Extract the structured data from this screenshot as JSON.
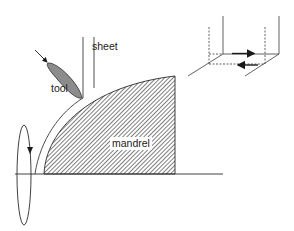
{
  "diagram": {
    "type": "schematic",
    "labels": {
      "sheet": "sheet",
      "tool": "tool",
      "mandrel": "mandrel"
    },
    "colors": {
      "stroke": "#2a2a2a",
      "tool_fill": "#8c8c8c",
      "hatch": "#3a3a3a",
      "background": "#ffffff"
    },
    "elements": [
      {
        "id": "mandrel",
        "kind": "hatched-region"
      },
      {
        "id": "sheet",
        "kind": "double-line"
      },
      {
        "id": "tool",
        "kind": "shaded-ellipse",
        "arrow": "feed-direction"
      },
      {
        "id": "rotation",
        "kind": "ellipse-arrow",
        "direction": "down"
      },
      {
        "id": "axis",
        "kind": "line"
      },
      {
        "id": "inset",
        "kind": "3d-shear-element",
        "arrows": [
          "right",
          "left"
        ]
      }
    ]
  }
}
